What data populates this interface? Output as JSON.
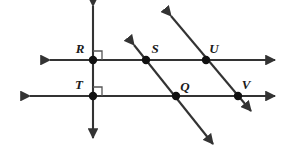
{
  "figure": {
    "background_color": "#ffffff",
    "line_color": "#333333",
    "point_color": "#111111",
    "label_color": "#1a1a1a",
    "width": 287,
    "height": 159
  },
  "points": [
    {
      "id": "R",
      "label": "R",
      "x": 93,
      "y": 60,
      "label_x": 80,
      "label_y": 53
    },
    {
      "id": "S",
      "label": "S",
      "x": 146,
      "y": 60,
      "label_x": 153,
      "label_y": 53
    },
    {
      "id": "U",
      "label": "U",
      "x": 206,
      "y": 60,
      "label_x": 212,
      "label_y": 53
    },
    {
      "id": "T",
      "label": "T",
      "x": 93,
      "y": 96,
      "label_x": 79,
      "label_y": 89
    },
    {
      "id": "Q",
      "label": "Q",
      "x": 176,
      "y": 96,
      "label_x": 183,
      "label_y": 91
    },
    {
      "id": "V",
      "label": "V",
      "x": 238,
      "y": 96,
      "label_x": 244,
      "label_y": 89
    }
  ],
  "lines": [
    {
      "id": "upper-horizontal",
      "name": "line-RSU",
      "through": "R, S, U",
      "x1": 48,
      "y1": 60,
      "x2": 277,
      "y2": 60,
      "arrows": "both"
    },
    {
      "id": "lower-horizontal",
      "name": "line-TQV",
      "through": "T, Q, V",
      "x1": 28,
      "y1": 96,
      "x2": 277,
      "y2": 96,
      "arrows": "both"
    },
    {
      "id": "vertical",
      "name": "line-RT",
      "through": "R, T",
      "x1": 93,
      "y1": 3,
      "x2": 93,
      "y2": 141,
      "arrows": "both"
    },
    {
      "id": "transversal-left",
      "name": "line-SQ",
      "through": "S, Q",
      "x1": 131,
      "y1": 41,
      "x2": 216,
      "y2": 148,
      "arrows": "both"
    },
    {
      "id": "transversal-right",
      "name": "line-UV",
      "through": "U, V",
      "x1": 168,
      "y1": 12,
      "x2": 254,
      "y2": 115,
      "arrows": "both"
    }
  ],
  "right_angle_marks": [
    {
      "id": "angle-at-R",
      "vertex": "R",
      "x": 93,
      "y": 60,
      "size": 9,
      "quadrant": "upper-right"
    },
    {
      "id": "angle-at-T",
      "vertex": "T",
      "x": 93,
      "y": 96,
      "size": 9,
      "quadrant": "upper-right"
    }
  ]
}
